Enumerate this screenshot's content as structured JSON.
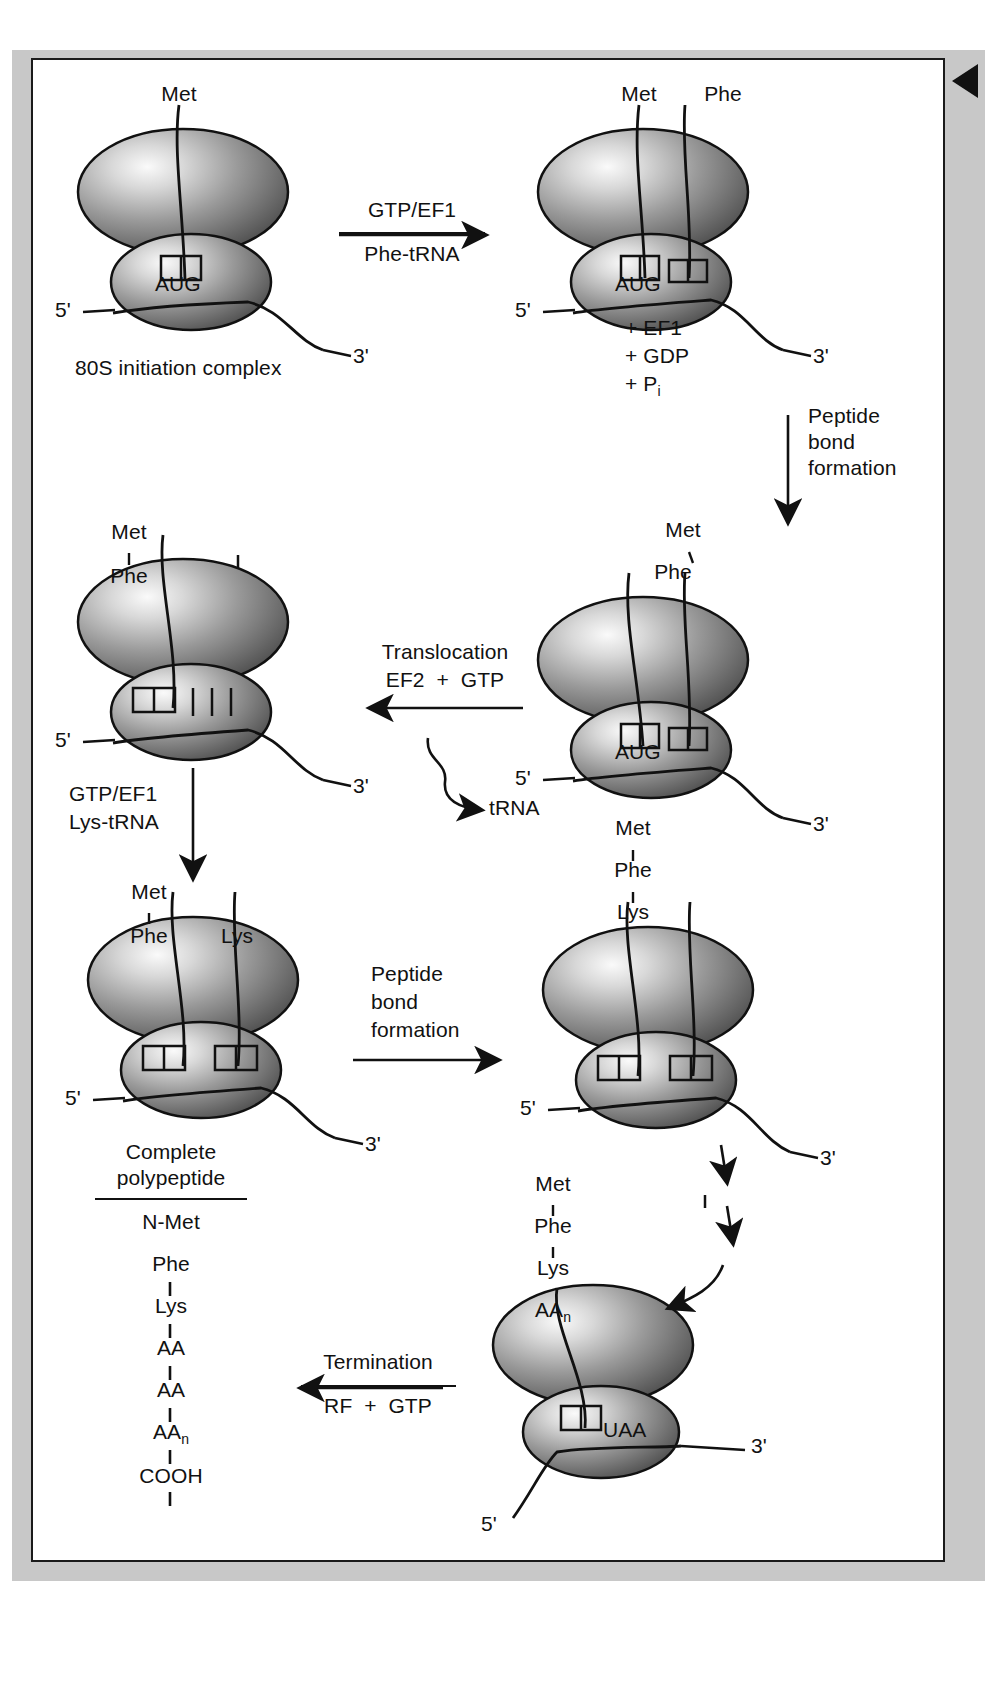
{
  "figure": {
    "corner_marker": "left-pointing-triangle"
  },
  "colors": {
    "page_background": "#ffffff",
    "margin_band": "#c8c8c8",
    "frame_border": "#1a1a1a",
    "ink": "#111111",
    "ribosome_light": "#f2f2f2",
    "ribosome_mid": "#8f8f8f",
    "ribosome_dark": "#4a4a4a"
  },
  "steps": [
    {
      "id": "step1",
      "caption": "80S initiation complex",
      "amino_acids": [
        "Met"
      ],
      "codon": "AUG",
      "mrna_ends": [
        "5'",
        "3'"
      ],
      "tRNA_sites": 1
    },
    {
      "id": "step2",
      "amino_acids": [
        "Met",
        "Phe"
      ],
      "codon": "AUG",
      "mrna_ends": [
        "5'",
        "3'"
      ],
      "byproducts": [
        "+ EF1",
        "+ GDP",
        "+ P"
      ],
      "byproduct_subscript": "i",
      "tRNA_sites": 2
    },
    {
      "id": "step3",
      "amino_acids": [
        "Met",
        "Phe"
      ],
      "codon": "AUG",
      "mrna_ends": [
        "5'",
        "3'"
      ],
      "tRNA_sites": 2
    },
    {
      "id": "step4",
      "amino_acids": [
        "Met",
        "Phe"
      ],
      "codon": "",
      "mrna_ends": [
        "5'",
        "3'"
      ],
      "tRNA_sites": 2
    },
    {
      "id": "step5",
      "amino_acids": [
        "Met",
        "Phe",
        "Lys"
      ],
      "codon": "",
      "mrna_ends": [
        "5'",
        "3'"
      ],
      "tRNA_sites": 2
    },
    {
      "id": "step6",
      "amino_acids": [
        "Met",
        "Phe",
        "Lys"
      ],
      "codon": "",
      "mrna_ends": [
        "5'",
        "3'"
      ],
      "tRNA_sites": 2
    },
    {
      "id": "step7",
      "amino_acids": [
        "Met",
        "Phe",
        "Lys",
        "AA"
      ],
      "aa_subscript": "n",
      "codon": "UAA",
      "mrna_ends": [
        "5'",
        "3'"
      ],
      "tRNA_sites": 1
    }
  ],
  "arrows": [
    {
      "id": "arrow-gtp-ef1",
      "above": "GTP/EF1",
      "below": "Phe-tRNA",
      "direction": "right"
    },
    {
      "id": "arrow-peptide-1",
      "lines": [
        "Peptide",
        "bond",
        "formation"
      ],
      "direction": "down"
    },
    {
      "id": "arrow-translocation",
      "lines": [
        "Translocation",
        "EF2  +  GTP"
      ],
      "direction": "left"
    },
    {
      "id": "arrow-trna-release",
      "label": "tRNA",
      "direction": "curved-right"
    },
    {
      "id": "arrow-gtp-ef1-lys",
      "lines": [
        "GTP/EF1",
        "Lys-tRNA"
      ],
      "direction": "down"
    },
    {
      "id": "arrow-peptide-2",
      "lines": [
        "Peptide",
        "bond",
        "formation"
      ],
      "direction": "right"
    },
    {
      "id": "arrow-elongation",
      "label": "",
      "direction": "down-dashed-diagonal",
      "segments": 3
    },
    {
      "id": "arrow-termination",
      "above": "Termination",
      "below": "RF  +  GTP",
      "direction": "left"
    }
  ],
  "polypeptide": {
    "heading_line1": "Complete",
    "heading_line2": "polypeptide",
    "residues": [
      "N-Met",
      "Phe",
      "Lys",
      "AA",
      "AA",
      "AA"
    ],
    "last_residue_subscript": "n",
    "terminus": "COOH"
  },
  "glyphs": {
    "five_prime": "5'",
    "three_prime": "3'"
  }
}
